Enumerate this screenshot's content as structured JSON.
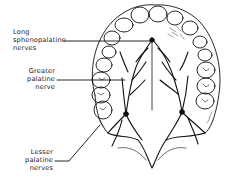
{
  "diagram": {
    "labels": [
      {
        "id": "long-sphenopalatine",
        "lines": [
          "Long",
          "sphenopalatine",
          "nerves"
        ],
        "align": "left"
      },
      {
        "id": "greater-palatine",
        "lines": [
          "Greater",
          "palatine",
          "nerve"
        ],
        "align": "right"
      },
      {
        "id": "lesser-palatine",
        "lines": [
          "Lesser",
          "palatine",
          "nerves"
        ],
        "align": "right"
      }
    ],
    "colors": {
      "ink": "#111111",
      "background": "#ffffff"
    }
  }
}
